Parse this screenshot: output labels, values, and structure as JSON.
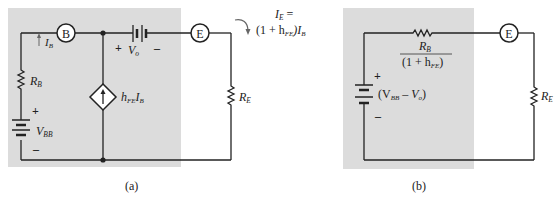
{
  "colors": {
    "shade": "#dcdcdc",
    "wire": "#222222",
    "background": "#ffffff"
  },
  "circuit_a": {
    "caption": "(a)",
    "node_b": "B",
    "node_e": "E",
    "ib_main": "I",
    "ib_sub": "B",
    "rb_main": "R",
    "rb_sub": "B",
    "re_main": "R",
    "re_sub": "E",
    "vbb_main": "V",
    "vbb_sub": "BB",
    "vo_main": "V",
    "vo_sub": "o",
    "plus": "+",
    "minus": "–",
    "source_h": "h",
    "source_sub": "FE",
    "source_i": "I",
    "source_i_sub": "B",
    "ie_line1_main": "I",
    "ie_line1_sub": "E",
    "ie_line1_eq": " =",
    "ie_line2_pre": "(1 + h",
    "ie_line2_sub": "FE",
    "ie_line2_post": ")I",
    "ie_line2_sub2": "B"
  },
  "circuit_b": {
    "caption": "(b)",
    "node_e": "E",
    "rb_main": "R",
    "rb_sub": "B",
    "den_pre": "(1 + h",
    "den_sub": "FE",
    "den_post": ")",
    "src_pre": "(V",
    "src_sub1": "BB",
    "src_mid": " – V",
    "src_sub2": "o",
    "src_post": ")",
    "re_main": "R",
    "re_sub": "E",
    "plus": "+",
    "minus": "–"
  }
}
